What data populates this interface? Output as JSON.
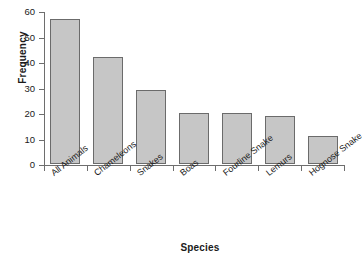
{
  "chart_data": {
    "type": "bar",
    "title": "",
    "xlabel": "Species",
    "ylabel": "Frequency",
    "categories": [
      "All Animals",
      "Chameleons",
      "Snakes",
      "Boas",
      "Fourline Snake",
      "Lemurs",
      "Hognose Snake"
    ],
    "values": [
      57,
      42,
      29,
      20,
      20,
      19,
      11
    ],
    "ylim": [
      0,
      60
    ],
    "yticks": [
      0,
      10,
      20,
      30,
      40,
      50,
      60
    ],
    "ytick_labels": [
      "0",
      "10",
      "20",
      "30",
      "40",
      "50",
      "60"
    ],
    "grid": false,
    "legend": false,
    "bar_fill_color": "#c6c6c6",
    "bar_edge_color": "#6b6b6b",
    "axis_color": "#6e6e6e",
    "text_color": "#1a1a1a",
    "background_color": "#ffffff",
    "xtick_label_rotation": -38
  }
}
